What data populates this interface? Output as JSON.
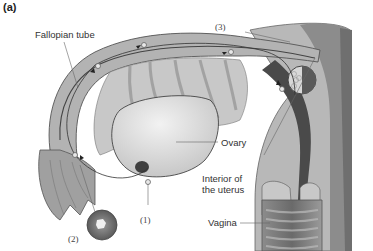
{
  "figure": {
    "panel_label": "(a)"
  },
  "labels": {
    "fallopian_tube": "Fallopian tube",
    "ovary": "Ovary",
    "interior_uterus_line1": "Interior of",
    "interior_uterus_line2": "the uterus",
    "vagina": "Vagina",
    "step1": "(1)",
    "step2": "(2)",
    "step3": "(3)"
  },
  "colors": {
    "tissue_light": "#cfcfcf",
    "tissue_mid": "#a9a9a9",
    "tissue_dark": "#6e6e6e",
    "ovary": "#d9d9d9",
    "lumen": "#4a4a4a",
    "leader_line": "#555555"
  }
}
